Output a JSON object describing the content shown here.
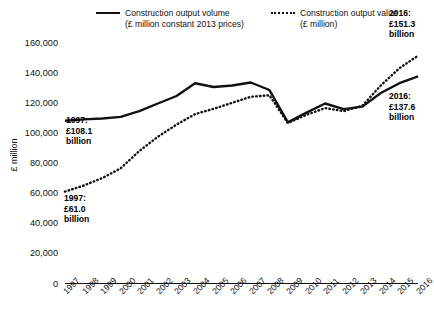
{
  "chart_data": {
    "type": "line",
    "title": "",
    "xlabel": "",
    "ylabel": "£ million",
    "ylim": [
      0,
      170000
    ],
    "yticks": [
      "0",
      "20,000",
      "40,000",
      "60,000",
      "80,000",
      "100,000",
      "120,000",
      "140,000",
      "160,000"
    ],
    "ytick_values": [
      0,
      20000,
      40000,
      60000,
      80000,
      100000,
      120000,
      140000,
      160000
    ],
    "grid": false,
    "legend_position": "top",
    "categories": [
      "1997",
      "1998",
      "1999",
      "2000",
      "2001",
      "2002",
      "2003",
      "2004",
      "2005",
      "2006",
      "2007",
      "2008",
      "2009",
      "2010",
      "2011",
      "2012",
      "2013",
      "2014",
      "2015",
      "2016"
    ],
    "series": [
      {
        "name": "Construction output volume",
        "unit": "£ million constant 2013 prices",
        "style": "solid",
        "color": "#111111",
        "values": [
          108100,
          109000,
          109600,
          110600,
          114500,
          119500,
          124500,
          133000,
          130500,
          131500,
          133500,
          128500,
          107000,
          113500,
          119500,
          115800,
          117500,
          126500,
          133000,
          137600
        ]
      },
      {
        "name": "Construction output value",
        "unit": "£ million",
        "style": "dotted",
        "color": "#111111",
        "values": [
          61000,
          65000,
          70000,
          76500,
          88000,
          97500,
          105500,
          112500,
          116000,
          120000,
          124000,
          125000,
          106500,
          112000,
          116500,
          114500,
          118000,
          131500,
          143000,
          151300
        ]
      }
    ],
    "annotations": [
      {
        "id": "vol-start",
        "lines": [
          "1997:",
          "£108.1",
          "billion"
        ]
      },
      {
        "id": "val-start",
        "lines": [
          "1997:",
          "£61.0",
          "billion"
        ]
      },
      {
        "id": "val-end",
        "lines": [
          "2016:",
          "£151.3",
          "billion"
        ]
      },
      {
        "id": "vol-end",
        "lines": [
          "2016:",
          "£137.6",
          "billion"
        ]
      }
    ]
  },
  "legend": {
    "volume_line1": "Construction output volume",
    "volume_line2": "(£ million constant 2013 prices)",
    "value_line1": "Construction output value",
    "value_line2": "(£ million)"
  },
  "axis": {
    "y_title": "£ million"
  }
}
